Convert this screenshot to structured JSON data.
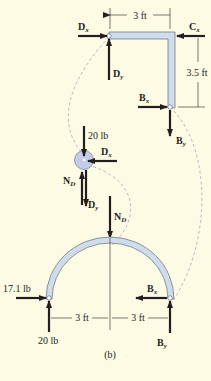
{
  "figure_label": "(b)",
  "member_bc": {
    "dim_horizontal": "3 ft",
    "dim_vertical": "3.5 ft",
    "labels": {
      "Dx": {
        "main": "D",
        "sub": "x"
      },
      "Dy": {
        "main": "D",
        "sub": "y"
      },
      "Cx": {
        "main": "C",
        "sub": "x"
      },
      "Bx": {
        "main": "B",
        "sub": "x"
      },
      "By": {
        "main": "B",
        "sub": "y"
      }
    }
  },
  "pulley_d": {
    "weight": "20 lb",
    "labels": {
      "Dx": {
        "main": "D",
        "sub": "x"
      },
      "ND": {
        "main": "N",
        "sub": "D"
      },
      "Dy": {
        "main": "D",
        "sub": "y"
      }
    }
  },
  "arch": {
    "left_horizontal": "17.1 lb",
    "left_vertical": "20 lb",
    "dim_left": "3 ft",
    "dim_right": "3 ft",
    "labels": {
      "ND": {
        "main": "N",
        "sub": "D"
      },
      "Bx": {
        "main": "B",
        "sub": "x"
      },
      "By": {
        "main": "B",
        "sub": "y"
      }
    }
  },
  "colors": {
    "background": "#fdfbe4",
    "member_fill": "#cfdcec",
    "force": "#231f20",
    "connector_dash": "#a9b4c4"
  }
}
